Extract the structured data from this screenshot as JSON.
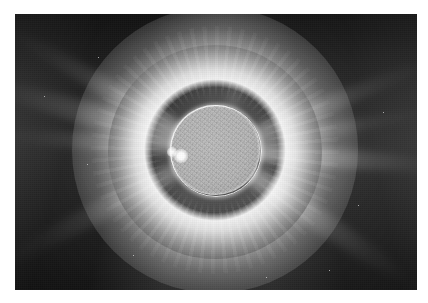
{
  "image": {
    "subject": "total-solar-eclipse-corona",
    "border_color": "#ffffff",
    "plate": {
      "x": 15,
      "y": 14,
      "width": 402,
      "height": 276
    },
    "background_color": "#3c3c3c",
    "caption": ""
  },
  "occulting_sphere": {
    "label": "dark-lunar-disk",
    "center_x": 215,
    "center_y": 152,
    "radius": 92,
    "color": "#0a0a0a"
  },
  "corona": {
    "label": "inner-corona-ring",
    "center_x": 215,
    "center_y": 150,
    "inner_radius": 46,
    "outer_radius": 92,
    "peak_color": "#ffffff",
    "streamers": [
      {
        "name": "streamer-west-upper",
        "angle_deg": 196,
        "length": 250,
        "thickness": 26,
        "intensity": 0.5
      },
      {
        "name": "streamer-west-mid",
        "angle_deg": 184,
        "length": 215,
        "thickness": 20,
        "intensity": 0.42
      },
      {
        "name": "streamer-northwest",
        "angle_deg": 210,
        "length": 235,
        "thickness": 22,
        "intensity": 0.46
      },
      {
        "name": "streamer-east-mid",
        "angle_deg": 4,
        "length": 240,
        "thickness": 22,
        "intensity": 0.58
      },
      {
        "name": "streamer-northeast",
        "angle_deg": 338,
        "length": 225,
        "thickness": 20,
        "intensity": 0.44
      },
      {
        "name": "streamer-east-upper",
        "angle_deg": 350,
        "length": 210,
        "thickness": 16,
        "intensity": 0.38
      },
      {
        "name": "streamer-southeast",
        "angle_deg": 34,
        "length": 230,
        "thickness": 26,
        "intensity": 0.52
      },
      {
        "name": "streamer-southwest",
        "angle_deg": 152,
        "length": 240,
        "thickness": 24,
        "intensity": 0.36
      },
      {
        "name": "streamer-north",
        "angle_deg": 290,
        "length": 120,
        "thickness": 18,
        "intensity": 0.18
      }
    ]
  },
  "solar_disk": {
    "label": "inner-gray-disk",
    "center_x": 215,
    "center_y": 150,
    "radius": 45,
    "color": "#b2b2b2"
  },
  "prominence": {
    "label": "bright-prominence-spot",
    "center_x": 181,
    "center_y": 156,
    "radius": 3,
    "color": "#ffffff",
    "secondary_center_x": 172,
    "secondary_center_y": 152,
    "secondary_radius": 2
  },
  "stars": [
    {
      "x": 98,
      "y": 57,
      "size": 1.4
    },
    {
      "x": 87,
      "y": 164,
      "size": 1.2
    },
    {
      "x": 133,
      "y": 255,
      "size": 1.3
    },
    {
      "x": 329,
      "y": 270,
      "size": 1.2
    },
    {
      "x": 383,
      "y": 112,
      "size": 1.1
    },
    {
      "x": 44,
      "y": 96,
      "size": 1.0
    },
    {
      "x": 266,
      "y": 277,
      "size": 1.0
    },
    {
      "x": 358,
      "y": 205,
      "size": 1.0
    }
  ]
}
